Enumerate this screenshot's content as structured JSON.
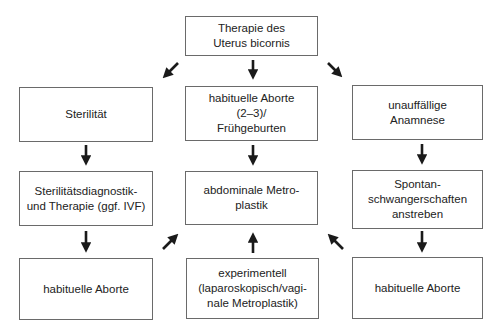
{
  "diagram": {
    "root": {
      "id": "root",
      "label": "Therapie des\nUterus bicornis"
    },
    "columns": [
      {
        "id": "left",
        "nodes": [
          {
            "label": "Sterilität"
          },
          {
            "label": "Sterilitätsdiagnostik-\nund Therapie (ggf. IVF)"
          },
          {
            "label": "habituelle Aborte"
          }
        ]
      },
      {
        "id": "center",
        "nodes": [
          {
            "label": "habituelle Aborte\n(2–3)/\nFrühgeburten"
          },
          {
            "label": "abdominale Metro-\nplastik"
          },
          {
            "label": "experimentell\n(laparoskopisch/vagi-\nnale Metroplastik)"
          }
        ]
      },
      {
        "id": "right",
        "nodes": [
          {
            "label": "unauffällige\nAnamnese"
          },
          {
            "label": "Spontan-\nschwangerschaften\nanstreben"
          },
          {
            "label": "habituelle Aborte"
          }
        ]
      }
    ],
    "edges": [
      {
        "from": "Therapie des Uterus bicornis",
        "to": "Sterilität",
        "arrow": "down-left"
      },
      {
        "from": "Therapie des Uterus bicornis",
        "to": "habituelle Aborte (2–3)/Frühgeburten",
        "arrow": "down"
      },
      {
        "from": "Therapie des Uterus bicornis",
        "to": "unauffällige Anamnese",
        "arrow": "down-right"
      },
      {
        "from": "Sterilität",
        "to": "Sterilitätsdiagnostik- und Therapie (ggf. IVF)",
        "arrow": "down"
      },
      {
        "from": "habituelle Aborte (2–3)/Frühgeburten",
        "to": "abdominale Metroplastik",
        "arrow": "down"
      },
      {
        "from": "unauffällige Anamnese",
        "to": "Spontanschwangerschaften anstreben",
        "arrow": "down"
      },
      {
        "from": "Sterilitätsdiagnostik- und Therapie (ggf. IVF)",
        "to": "habituelle Aborte",
        "arrow": "down"
      },
      {
        "from": "Spontanschwangerschaften anstreben",
        "to": "habituelle Aborte",
        "arrow": "down"
      },
      {
        "from": "habituelle Aborte (left)",
        "to": "abdominale Metroplastik",
        "arrow": "up-right"
      },
      {
        "from": "experimentell (laparoskopisch/vaginale Metroplastik)",
        "to": "abdominale Metroplastik",
        "arrow": "up"
      },
      {
        "from": "habituelle Aborte (right)",
        "to": "abdominale Metroplastik",
        "arrow": "up-left"
      }
    ],
    "colors": {
      "border": "#6a6a6a",
      "arrow": "#1a1a1a",
      "text": "#222222",
      "background": "#ffffff"
    }
  }
}
